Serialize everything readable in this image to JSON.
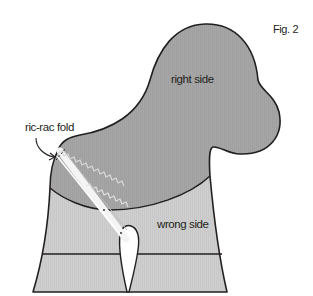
{
  "figure": {
    "label": "Fig. 2",
    "colors": {
      "right_side_fill": "#a6a6a6",
      "wrong_side_fill": "#cfcfcf",
      "outline": "#231f20",
      "ricrac": "#ececec",
      "background": "#ffffff"
    }
  },
  "labels": {
    "right_side": "right side",
    "wrong_side": "wrong side",
    "ricrac_fold": "ric-rac fold"
  }
}
